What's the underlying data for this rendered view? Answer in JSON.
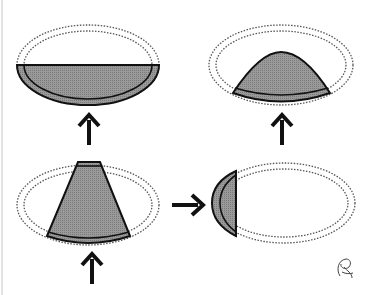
{
  "diagram": {
    "type": "schematic",
    "colors": {
      "fill": "#8e8e8e",
      "stroke": "#111111",
      "dotted": "#555555",
      "background": "#ffffff"
    },
    "panels": [
      {
        "id": "top-left",
        "label": "lower-half-shaded-ellipse",
        "arrow": "up"
      },
      {
        "id": "top-right",
        "label": "dome-shaded-segment",
        "arrow": "up"
      },
      {
        "id": "bottom-left",
        "label": "trapezoid-shaded-sector",
        "arrow": "up"
      },
      {
        "id": "bottom-right",
        "label": "lateral-cap-shaded",
        "arrow": "right-pointing-into"
      }
    ],
    "signature": "signature-mark"
  }
}
